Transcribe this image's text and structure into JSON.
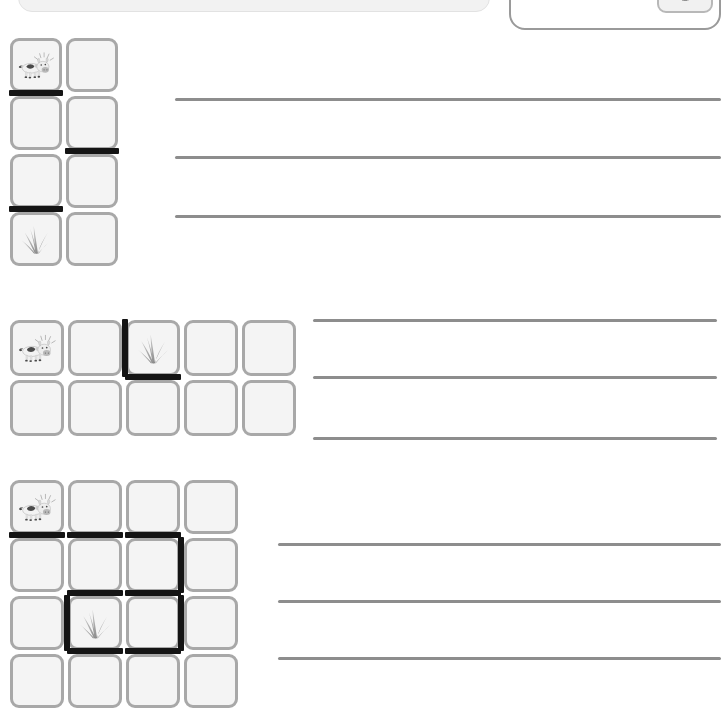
{
  "page": {
    "width": 721,
    "height": 703,
    "background": "#ffffff"
  },
  "top_bar": {
    "visible_fragment": true,
    "label": ""
  },
  "legend": {
    "name": "key-box",
    "text": "Down 1",
    "tile_icon": "grass-icon",
    "border_color": "#9a9a9a",
    "tile_bg": "#f1f1f1"
  },
  "icons": {
    "cow": "cow-icon",
    "grass": "grass-icon"
  },
  "colors": {
    "tile_fill": "#f4f4f4",
    "tile_border": "#a8a8a8",
    "wall": "#141414",
    "rule": "#8d8d8d"
  },
  "puzzles": [
    {
      "id": "puzzle-1",
      "rows": 4,
      "cols": 2,
      "origin": {
        "x": 8,
        "y": 36
      },
      "cell": {
        "w": 56,
        "h": 58
      },
      "start": {
        "row": 0,
        "col": 0,
        "icon": "cow-icon"
      },
      "goal": {
        "row": 3,
        "col": 0,
        "icon": "grass-icon"
      },
      "walls": [
        {
          "row": 0,
          "col": 0,
          "side": "bottom"
        },
        {
          "row": 1,
          "col": 1,
          "side": "bottom"
        },
        {
          "row": 2,
          "col": 0,
          "side": "bottom"
        }
      ],
      "answer_lines": {
        "x": 175,
        "width": 546,
        "ys": [
          98,
          156,
          215
        ]
      }
    },
    {
      "id": "puzzle-2",
      "rows": 2,
      "cols": 5,
      "origin": {
        "x": 8,
        "y": 318
      },
      "cell": {
        "w": 58,
        "h": 60
      },
      "start": {
        "row": 0,
        "col": 0,
        "icon": "cow-icon"
      },
      "goal": {
        "row": 0,
        "col": 2,
        "icon": "grass-icon"
      },
      "walls": [
        {
          "row": 0,
          "col": 2,
          "side": "left"
        },
        {
          "row": 0,
          "col": 2,
          "side": "bottom"
        }
      ],
      "answer_lines": {
        "x": 313,
        "width": 404,
        "ys": [
          319,
          376,
          437
        ]
      }
    },
    {
      "id": "puzzle-3",
      "rows": 4,
      "cols": 4,
      "origin": {
        "x": 8,
        "y": 478
      },
      "cell": {
        "w": 58,
        "h": 58
      },
      "start": {
        "row": 0,
        "col": 0,
        "icon": "cow-icon"
      },
      "goal": {
        "row": 2,
        "col": 1,
        "icon": "grass-icon"
      },
      "walls": [
        {
          "row": 0,
          "col": 0,
          "side": "bottom"
        },
        {
          "row": 0,
          "col": 1,
          "side": "bottom"
        },
        {
          "row": 0,
          "col": 2,
          "side": "bottom"
        },
        {
          "row": 1,
          "col": 2,
          "side": "right"
        },
        {
          "row": 1,
          "col": 1,
          "side": "bottom"
        },
        {
          "row": 1,
          "col": 2,
          "side": "bottom"
        },
        {
          "row": 2,
          "col": 1,
          "side": "left"
        },
        {
          "row": 2,
          "col": 2,
          "side": "right"
        },
        {
          "row": 2,
          "col": 1,
          "side": "bottom"
        },
        {
          "row": 2,
          "col": 2,
          "side": "bottom"
        }
      ],
      "answer_lines": {
        "x": 278,
        "width": 443,
        "ys": [
          543,
          600,
          657
        ]
      }
    }
  ]
}
